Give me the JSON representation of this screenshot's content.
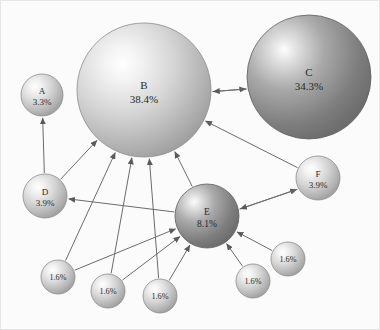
{
  "figure": {
    "type": "network-diagram",
    "background_color": "#fbfbfb",
    "edge_color": "#6b6b6b",
    "label_color": "#2a2a2a"
  },
  "chart_data": {
    "type": "scatter",
    "title": "",
    "xlabel": "",
    "ylabel": "",
    "legend": [],
    "nodes": [
      {
        "id": "A",
        "name": "A",
        "value_label": "3.3%",
        "value": 3.3,
        "cx": 42,
        "cy": 95,
        "r": 21,
        "shade": "light"
      },
      {
        "id": "B",
        "name": "B",
        "value_label": "38.4%",
        "value": 38.4,
        "cx": 144,
        "cy": 90,
        "r": 67,
        "shade": "light"
      },
      {
        "id": "C",
        "name": "C",
        "value_label": "34.3%",
        "value": 34.3,
        "cx": 309,
        "cy": 77,
        "r": 62,
        "shade": "dark"
      },
      {
        "id": "D",
        "name": "D",
        "value_label": "3.9%",
        "value": 3.9,
        "cx": 45,
        "cy": 196,
        "r": 22,
        "shade": "light"
      },
      {
        "id": "E",
        "name": "E",
        "value_label": "8.1%",
        "value": 8.1,
        "cx": 207,
        "cy": 216,
        "r": 32,
        "shade": "dark"
      },
      {
        "id": "F",
        "name": "F",
        "value_label": "3.9%",
        "value": 3.9,
        "cx": 318,
        "cy": 178,
        "r": 22,
        "shade": "light"
      },
      {
        "id": "S1",
        "name": "",
        "value_label": "1.6%",
        "value": 1.6,
        "cx": 58,
        "cy": 277,
        "r": 17,
        "shade": "light"
      },
      {
        "id": "S2",
        "name": "",
        "value_label": "1.6%",
        "value": 1.6,
        "cx": 108,
        "cy": 291,
        "r": 17,
        "shade": "light"
      },
      {
        "id": "S3",
        "name": "",
        "value_label": "1.6%",
        "value": 1.6,
        "cx": 160,
        "cy": 296,
        "r": 17,
        "shade": "light"
      },
      {
        "id": "S4",
        "name": "",
        "value_label": "1.6%",
        "value": 1.6,
        "cx": 253,
        "cy": 281,
        "r": 17,
        "shade": "light"
      },
      {
        "id": "S5",
        "name": "",
        "value_label": "1.6%",
        "value": 1.6,
        "cx": 288,
        "cy": 259,
        "r": 17,
        "shade": "light"
      }
    ],
    "edges": [
      {
        "from": "B",
        "to": "C",
        "direction": "forward",
        "offset": 7
      },
      {
        "from": "C",
        "to": "B",
        "direction": "forward",
        "offset": -7
      },
      {
        "from": "D",
        "to": "A",
        "direction": "forward",
        "offset": 0
      },
      {
        "from": "D",
        "to": "B",
        "direction": "forward",
        "offset": 0
      },
      {
        "from": "F",
        "to": "B",
        "direction": "forward",
        "offset": 0
      },
      {
        "from": "E",
        "to": "B",
        "direction": "forward",
        "offset": 0
      },
      {
        "from": "E",
        "to": "D",
        "direction": "forward",
        "offset": 0
      },
      {
        "from": "E",
        "to": "F",
        "direction": "forward",
        "offset": 4
      },
      {
        "from": "F",
        "to": "E",
        "direction": "forward",
        "offset": -4
      },
      {
        "from": "S1",
        "to": "B",
        "direction": "forward",
        "offset": 0
      },
      {
        "from": "S2",
        "to": "B",
        "direction": "forward",
        "offset": 0
      },
      {
        "from": "S3",
        "to": "B",
        "direction": "forward",
        "offset": 0
      },
      {
        "from": "S1",
        "to": "E",
        "direction": "forward",
        "offset": 0
      },
      {
        "from": "S2",
        "to": "E",
        "direction": "forward",
        "offset": 0
      },
      {
        "from": "S3",
        "to": "E",
        "direction": "forward",
        "offset": 0
      },
      {
        "from": "S4",
        "to": "E",
        "direction": "forward",
        "offset": 0
      },
      {
        "from": "S5",
        "to": "E",
        "direction": "forward",
        "offset": 0
      }
    ]
  }
}
